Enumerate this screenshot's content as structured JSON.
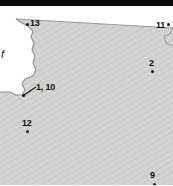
{
  "figure": {
    "kind": "map-crop",
    "width": 173,
    "height": 185,
    "background_color": "#ffffff",
    "land_fill_color": "#d2d2d2",
    "land_hatch_color": "#bdbdbd",
    "water_fill_color": "#ffffff",
    "coastline_color": "#8a8a8a",
    "marker_color": "#111111",
    "label_color": "#111111",
    "top_band_color": "#0b0b0b"
  },
  "water_label": {
    "text": "f"
  },
  "markers": [
    {
      "id": "13",
      "label": "13",
      "label_prefix_dot": true,
      "x": 27,
      "y": 24,
      "label_x": 30,
      "label_y": 20
    },
    {
      "id": "11",
      "label": "11",
      "label_prefix_dot": false,
      "x": 168,
      "y": 24,
      "label_x": 157,
      "label_y": 22
    },
    {
      "id": "2",
      "label": "2",
      "label_prefix_dot": false,
      "x": 152,
      "y": 71,
      "label_x": 149,
      "label_y": 59
    },
    {
      "id": "1-10",
      "label": "1, 10",
      "label_prefix_dot": false,
      "x": 23,
      "y": 95,
      "label_x": 35,
      "label_y": 84
    },
    {
      "id": "12",
      "label": "12",
      "label_prefix_dot": false,
      "x": 27,
      "y": 131,
      "label_x": 23,
      "label_y": 119
    },
    {
      "id": "9",
      "label": "9",
      "label_prefix_dot": false,
      "x": 154,
      "y": 185,
      "label_x": 150,
      "label_y": 172
    }
  ],
  "leader_line": {
    "from_x": 24,
    "from_y": 95,
    "to_x": 36,
    "to_y": 87
  }
}
